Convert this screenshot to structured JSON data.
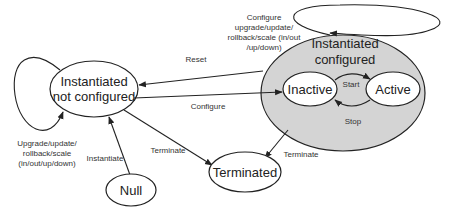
{
  "diagram": {
    "colors": {
      "container_fill": "#d4d4d4",
      "node_fill": "#ffffff",
      "stroke": "#222222"
    },
    "states": {
      "null": "Null",
      "not_configured": [
        "Instantiated",
        "not configured"
      ],
      "configured": [
        "Instantiated",
        "configured"
      ],
      "inactive": "Inactive",
      "active": "Active",
      "terminated": "Terminated"
    },
    "transitions": {
      "instantiate": "Instantiate",
      "configure": "Configure",
      "reset": "Reset",
      "terminate_from_not_configured": "Terminate",
      "terminate_from_configured": "Terminate",
      "start": "Start",
      "stop": "Stop",
      "self_loop_not_configured": [
        "Upgrade/update/",
        "rollback/scale",
        "(in/out/up/down)"
      ],
      "self_loop_configured": [
        "Configure",
        "upgrade/update/",
        "rollback/scale (in/out",
        "/up/down)"
      ]
    }
  }
}
